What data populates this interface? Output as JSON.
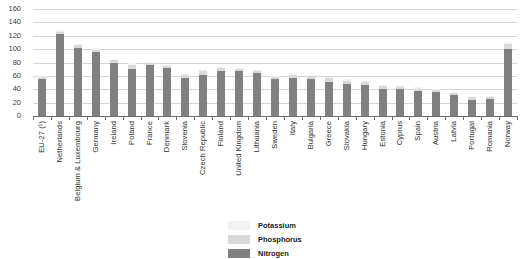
{
  "chart_data": {
    "type": "bar",
    "stacked": true,
    "title": "",
    "subtitle": "",
    "xlabel": "",
    "ylabel": "",
    "ylim": [
      0,
      160
    ],
    "ytick_step": 20,
    "yticks": [
      160,
      140,
      120,
      100,
      80,
      60,
      40,
      20,
      0
    ],
    "grid": true,
    "legend_position": "bottom-center",
    "categories": [
      "EU-27 (¹)",
      "Netherlands",
      "Belgium & Luxembourg",
      "Germany",
      "Ireland",
      "Poland",
      "France",
      "Denmark",
      "Slovenia",
      "Czech Republic",
      "Finland",
      "United Kingdom",
      "Lithuania",
      "Sweden",
      "Italy",
      "Bulgaria",
      "Greece",
      "Slovakia",
      "Hungary",
      "Estonia",
      "Cyprus",
      "Spain",
      "Austria",
      "Latvia",
      "Portugal",
      "Romania",
      "Norway"
    ],
    "series": [
      {
        "name": "Nitrogen",
        "color": "#808080",
        "values": [
          55,
          122,
          101,
          95,
          80,
          71,
          76,
          72,
          57,
          62,
          68,
          67,
          65,
          55,
          57,
          56,
          51,
          48,
          47,
          41,
          40,
          37,
          36,
          31,
          24,
          25,
          100
        ]
      },
      {
        "name": "Phosphorus",
        "color": "#d9d9d9",
        "values": [
          4,
          4,
          5,
          4,
          4,
          6,
          3,
          3,
          4,
          5,
          4,
          3,
          3,
          3,
          5,
          4,
          6,
          5,
          4,
          4,
          4,
          4,
          3,
          3,
          4,
          3,
          8
        ]
      },
      {
        "name": "Potassium",
        "color": "#f2f2f2",
        "values": [
          2,
          2,
          2,
          2,
          2,
          2,
          2,
          2,
          2,
          2,
          2,
          2,
          2,
          2,
          2,
          2,
          2,
          2,
          2,
          2,
          2,
          2,
          2,
          2,
          2,
          2,
          2
        ]
      }
    ],
    "legend": [
      {
        "label": "Potassium",
        "color": "#f2f2f2"
      },
      {
        "label": "Phosphorus",
        "color": "#d9d9d9"
      },
      {
        "label": "Nitrogen",
        "color": "#808080"
      }
    ]
  }
}
